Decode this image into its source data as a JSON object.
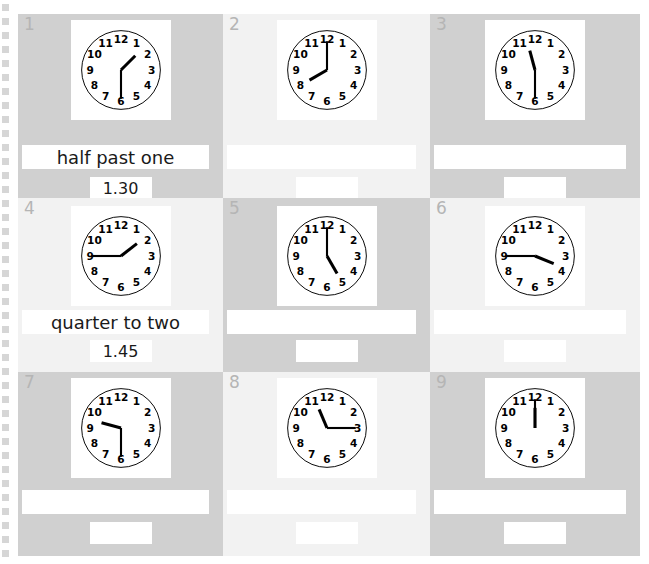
{
  "worksheet": {
    "page_background": "#ffffff",
    "shade_dark": "#d0d0d0",
    "shade_light": "#f2f2f2",
    "binding": {
      "icon": "spiral-binding-holes",
      "hole_color": "#d6d6d6",
      "hole_count": 40
    },
    "clock_numerals": [
      "1",
      "2",
      "3",
      "4",
      "5",
      "6",
      "7",
      "8",
      "9",
      "10",
      "11",
      "12"
    ],
    "cells": [
      {
        "number": "1",
        "shade": "dark",
        "clock": {
          "hour_angle": 45,
          "minute_angle": 180,
          "time": "1.30"
        },
        "words_answer": "half past one",
        "digits_answer": "1.30",
        "filled": true
      },
      {
        "number": "2",
        "shade": "light",
        "clock": {
          "hour_angle": 240,
          "minute_angle": 0,
          "time": "8.00"
        },
        "words_answer": "",
        "digits_answer": "",
        "filled": false
      },
      {
        "number": "3",
        "shade": "dark",
        "clock": {
          "hour_angle": 345,
          "minute_angle": 180,
          "time": "11.30"
        },
        "words_answer": "",
        "digits_answer": "",
        "filled": false
      },
      {
        "number": "4",
        "shade": "light",
        "clock": {
          "hour_angle": 52,
          "minute_angle": 270,
          "time": "1.45"
        },
        "words_answer": "quarter to two",
        "digits_answer": "1.45",
        "filled": true
      },
      {
        "number": "5",
        "shade": "dark",
        "clock": {
          "hour_angle": 150,
          "minute_angle": 0,
          "time": "5.00"
        },
        "words_answer": "",
        "digits_answer": "",
        "filled": false
      },
      {
        "number": "6",
        "shade": "light",
        "clock": {
          "hour_angle": 112,
          "minute_angle": 270,
          "time": "3.45"
        },
        "words_answer": "",
        "digits_answer": "",
        "filled": false
      },
      {
        "number": "7",
        "shade": "dark",
        "clock": {
          "hour_angle": 285,
          "minute_angle": 180,
          "time": "9.30"
        },
        "words_answer": "",
        "digits_answer": "",
        "filled": false
      },
      {
        "number": "8",
        "shade": "light",
        "clock": {
          "hour_angle": 337,
          "minute_angle": 90,
          "time": "11.15"
        },
        "words_answer": "",
        "digits_answer": "",
        "filled": false
      },
      {
        "number": "9",
        "shade": "dark",
        "clock": {
          "hour_angle": 0,
          "minute_angle": 0,
          "time": "12.00"
        },
        "words_answer": "",
        "digits_answer": "",
        "filled": false
      }
    ]
  }
}
